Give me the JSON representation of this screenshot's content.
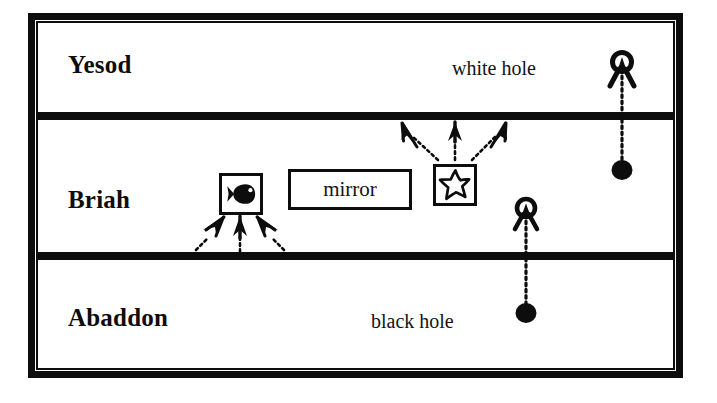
{
  "diagram": {
    "background_color": "#ffffff",
    "ink_color": "#0d0d0d",
    "bands": [
      {
        "id": "yesod",
        "label": "Yesod",
        "order": 1
      },
      {
        "id": "briah",
        "label": "Briah",
        "order": 2
      },
      {
        "id": "abaddon",
        "label": "Abaddon",
        "order": 3
      }
    ],
    "boxes": [
      {
        "id": "mirror",
        "label": "mirror",
        "kind": "text-box",
        "band": "briah"
      },
      {
        "id": "fish-box",
        "label": "",
        "kind": "icon-box",
        "icon": "fish-icon",
        "band": "briah"
      },
      {
        "id": "star-box",
        "label": "",
        "kind": "icon-box",
        "icon": "star-icon",
        "band": "briah"
      }
    ],
    "annotations": [
      {
        "id": "white-hole-label",
        "text": "white hole",
        "band": "yesod"
      },
      {
        "id": "black-hole-label",
        "text": "black hole",
        "band": "abaddon"
      }
    ],
    "objects": [
      {
        "id": "white-hole-upper",
        "type": "white-hole",
        "band": "yesod",
        "paired_with": "black-hole-upper",
        "connector": "dotted-vertical"
      },
      {
        "id": "black-hole-upper",
        "type": "black-hole",
        "band": "briah",
        "paired_with": "white-hole-upper",
        "connector": "dotted-vertical"
      },
      {
        "id": "white-hole-lower",
        "type": "white-hole",
        "band": "briah",
        "paired_with": "black-hole-lower",
        "connector": "dotted-vertical"
      },
      {
        "id": "black-hole-lower",
        "type": "black-hole",
        "band": "abaddon",
        "paired_with": "white-hole-lower",
        "connector": "dotted-vertical"
      }
    ],
    "rays": [
      {
        "id": "ray-star-up-left",
        "from": "star-box",
        "to": "yesod-boundary",
        "direction": "up",
        "style": "dotted-with-arrowhead"
      },
      {
        "id": "ray-star-up-center",
        "from": "star-box",
        "to": "yesod-boundary",
        "direction": "up",
        "style": "dotted-with-arrowhead"
      },
      {
        "id": "ray-star-up-right",
        "from": "star-box",
        "to": "yesod-boundary",
        "direction": "up",
        "style": "dotted-with-arrowhead"
      },
      {
        "id": "ray-fish-up-left",
        "from": "abaddon-boundary",
        "to": "fish-box",
        "direction": "up",
        "style": "dotted-with-arrowhead"
      },
      {
        "id": "ray-fish-up-center",
        "from": "abaddon-boundary",
        "to": "fish-box",
        "direction": "up",
        "style": "dotted-with-arrowhead"
      },
      {
        "id": "ray-fish-up-right",
        "from": "abaddon-boundary",
        "to": "fish-box",
        "direction": "up",
        "style": "dotted-with-arrowhead"
      }
    ]
  }
}
